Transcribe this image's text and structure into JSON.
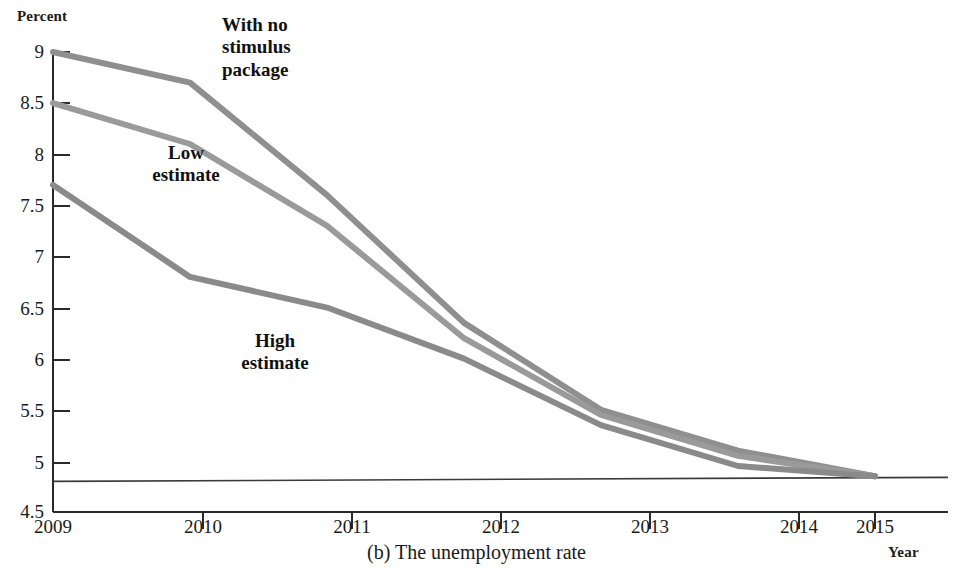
{
  "figure": {
    "caption": "(b) The unemployment rate",
    "y_axis_title": "Percent",
    "x_axis_title": "Year"
  },
  "chart_data": {
    "type": "line",
    "title": "(b) The unemployment rate",
    "xlabel": "Year",
    "ylabel": "Percent",
    "x": [
      2009,
      2010,
      2011,
      2012,
      2013,
      2014,
      2015
    ],
    "xlim": [
      2009,
      2015
    ],
    "ylim": [
      4.5,
      9
    ],
    "grid": false,
    "legend_position": "inline-annotations",
    "y_ticks": [
      "4.5",
      "5",
      "5.5",
      "6",
      "6.5",
      "7",
      "7.5",
      "8",
      "8.5",
      "9"
    ],
    "y_tick_values": [
      4.5,
      5,
      5.5,
      6,
      6.5,
      7,
      7.5,
      8,
      8.5,
      9
    ],
    "x_ticks": [
      "2009",
      "2010",
      "2011",
      "2012",
      "2013",
      "2014",
      "2015"
    ],
    "series": [
      {
        "name": "With no stimulus package",
        "color": "#8f8f8f",
        "values": [
          9.0,
          8.7,
          7.6,
          6.35,
          5.5,
          5.1,
          4.85
        ]
      },
      {
        "name": "Low estimate",
        "color": "#9a9a9a",
        "values": [
          8.5,
          8.1,
          7.3,
          6.2,
          5.45,
          5.05,
          4.85
        ]
      },
      {
        "name": "High estimate",
        "color": "#8a8a8a",
        "values": [
          7.7,
          6.8,
          6.5,
          6.0,
          5.35,
          4.95,
          4.85
        ]
      }
    ],
    "reference_line": {
      "name": "baseline",
      "value": 4.8,
      "color": "#3a3a3a"
    },
    "annotations": [
      {
        "name": "With no\nstimulus\npackage",
        "series": "With no stimulus package"
      },
      {
        "name": "Low\nestimate",
        "series": "Low estimate"
      },
      {
        "name": "High\nestimate",
        "series": "High estimate"
      }
    ]
  },
  "axis": {
    "y_labels": [
      "9",
      "8.5",
      "8",
      "7.5",
      "7",
      "6.5",
      "6",
      "5.5",
      "5",
      "4.5"
    ],
    "x_labels": [
      "2009",
      "2010",
      "2011",
      "2012",
      "2013",
      "2014",
      "2015"
    ]
  },
  "annotations": {
    "no_stimulus": "With no\nstimulus\npackage",
    "low": "Low\nestimate",
    "high": "High\nestimate"
  },
  "colors": {
    "line": "#8f8f8f",
    "axis": "#2a2a2a",
    "text": "#1a1a1a"
  }
}
